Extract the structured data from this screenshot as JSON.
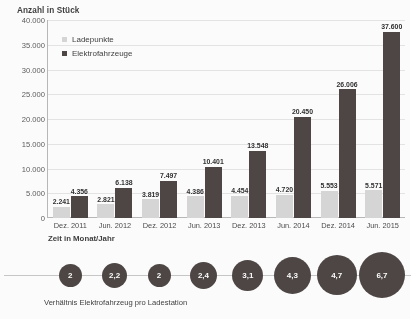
{
  "chart_data": {
    "type": "bar",
    "title": "",
    "ylabel": "Anzahl in Stück",
    "xlabel": "Zeit in Monat/Jahr",
    "ylim": [
      0,
      40000
    ],
    "ytick_labels": [
      "40.000",
      "35.000",
      "30.000",
      "25.000",
      "20.000",
      "15.000",
      "10.000",
      "5.000",
      "0"
    ],
    "ytick_values": [
      40000,
      35000,
      30000,
      25000,
      20000,
      15000,
      10000,
      5000,
      0
    ],
    "grid": true,
    "legend_position": "top-left",
    "categories": [
      "Dez. 2011",
      "Jun. 2012",
      "Dez. 2012",
      "Jun. 2013",
      "Dez. 2013",
      "Jun. 2014",
      "Dez. 2014",
      "Jun. 2015"
    ],
    "series": [
      {
        "name": "Ladepunkte",
        "color": "#d8d8d8",
        "values": [
          2241,
          2821,
          3819,
          4386,
          4454,
          4720,
          5553,
          5571
        ],
        "labels": [
          "2.241",
          "2.821",
          "3.819",
          "4.386",
          "4.454",
          "4.720",
          "5.553",
          "5.571"
        ]
      },
      {
        "name": "Elektrofahrzeuge",
        "color": "#4b4442",
        "values": [
          4356,
          6138,
          7497,
          10401,
          13548,
          20450,
          26006,
          37600
        ],
        "labels": [
          "4.356",
          "6.138",
          "7.497",
          "10.401",
          "13.548",
          "20.450",
          "26.006",
          "37.600"
        ]
      }
    ],
    "annotation_series": {
      "name": "Verhältnis Elektrofahrzeug pro Ladestation",
      "caption": "Verhältnis Elektrofahrzeug pro Ladestation",
      "color": "#4b4442",
      "labels": [
        "2",
        "2,2",
        "2",
        "2,4",
        "3,1",
        "4,3",
        "4,7",
        "6,7"
      ],
      "values": [
        2,
        2.2,
        2,
        2.4,
        3.1,
        4.3,
        4.7,
        6.7
      ],
      "diameters_px": [
        23,
        25,
        23,
        27,
        31,
        37,
        40,
        46
      ]
    }
  }
}
